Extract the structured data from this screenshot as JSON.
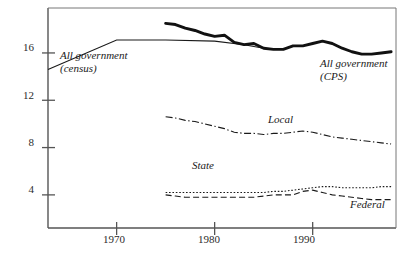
{
  "chart_data": {
    "type": "line",
    "title": "",
    "xlabel": "",
    "ylabel": "",
    "xlim": [
      1963,
      1998.5
    ],
    "ylim": [
      1.2,
      19.8
    ],
    "grid": false,
    "legend_position": "inline-annotations",
    "xticks": [
      1970,
      1980,
      1990
    ],
    "xtick_labels": [
      "1970",
      "1980",
      "1990"
    ],
    "yticks": [
      4,
      8,
      12,
      16
    ],
    "ytick_labels": [
      "4",
      "8",
      "12",
      "16"
    ],
    "series": [
      {
        "name": "All government (census)",
        "style": "thin-solid",
        "label_text_line1": "All government",
        "label_text_line2": "(census)",
        "x": [
          1963,
          1970,
          1975,
          1980,
          1983,
          1985
        ],
        "values": [
          14.6,
          17.1,
          17.1,
          17.0,
          16.7,
          16.4
        ]
      },
      {
        "name": "All government (CPS)",
        "style": "thick-solid",
        "label_text_line1": "All government",
        "label_text_line2": "(CPS)",
        "x": [
          1975,
          1976,
          1977,
          1978,
          1979,
          1980,
          1981,
          1982,
          1983,
          1984,
          1985,
          1986,
          1987,
          1988,
          1989,
          1990,
          1991,
          1992,
          1993,
          1994,
          1995,
          1996,
          1997,
          1998
        ],
        "values": [
          18.5,
          18.4,
          18.1,
          17.9,
          17.6,
          17.4,
          17.5,
          16.9,
          16.7,
          16.8,
          16.4,
          16.3,
          16.3,
          16.6,
          16.6,
          16.8,
          17.0,
          16.8,
          16.4,
          16.1,
          15.9,
          15.9,
          16.0,
          16.1
        ]
      },
      {
        "name": "Local",
        "style": "dash-dot",
        "label_text_line1": "Local",
        "x": [
          1975,
          1976,
          1977,
          1978,
          1979,
          1980,
          1981,
          1982,
          1983,
          1984,
          1985,
          1986,
          1987,
          1988,
          1989,
          1990,
          1991,
          1992,
          1993,
          1994,
          1995,
          1996,
          1997,
          1998
        ],
        "values": [
          10.6,
          10.5,
          10.3,
          10.2,
          10.0,
          9.8,
          9.6,
          9.3,
          9.2,
          9.2,
          9.1,
          9.2,
          9.2,
          9.3,
          9.4,
          9.3,
          9.1,
          8.9,
          8.8,
          8.7,
          8.6,
          8.5,
          8.4,
          8.3
        ]
      },
      {
        "name": "State",
        "style": "dotted",
        "label_text_line1": "State",
        "x": [
          1975,
          1976,
          1977,
          1978,
          1979,
          1980,
          1981,
          1982,
          1983,
          1984,
          1985,
          1986,
          1987,
          1988,
          1989,
          1990,
          1991,
          1992,
          1993,
          1994,
          1995,
          1996,
          1997,
          1998
        ],
        "values": [
          4.2,
          4.2,
          4.2,
          4.2,
          4.2,
          4.2,
          4.2,
          4.2,
          4.2,
          4.2,
          4.2,
          4.3,
          4.3,
          4.4,
          4.5,
          4.6,
          4.7,
          4.7,
          4.6,
          4.6,
          4.6,
          4.6,
          4.7,
          4.7
        ]
      },
      {
        "name": "Federal",
        "style": "dashed",
        "label_text_line1": "Federal",
        "x": [
          1975,
          1976,
          1977,
          1978,
          1979,
          1980,
          1981,
          1982,
          1983,
          1984,
          1985,
          1986,
          1987,
          1988,
          1989,
          1990,
          1991,
          1992,
          1993,
          1994,
          1995,
          1996,
          1997,
          1998
        ],
        "values": [
          4.0,
          3.9,
          3.8,
          3.8,
          3.8,
          3.8,
          3.8,
          3.8,
          3.8,
          3.8,
          3.9,
          4.0,
          4.0,
          4.0,
          4.3,
          4.4,
          4.2,
          4.0,
          3.9,
          3.8,
          3.7,
          3.6,
          3.6,
          3.6
        ]
      }
    ]
  },
  "axis": {
    "line_color": "#555555",
    "tick_color": "#555555"
  },
  "series_colors": {
    "all_government_census": "#1a1a1a",
    "all_government_cps": "#111111",
    "local": "#1a1a1a",
    "state": "#1a1a1a",
    "federal": "#1a1a1a"
  },
  "annotations": {
    "census_line1": "All government",
    "census_line2": "(census)",
    "cps_line1": "All government",
    "cps_line2": "(CPS)",
    "local": "Local",
    "state": "State",
    "federal": "Federal"
  },
  "ticks": {
    "y": [
      {
        "label": "16"
      },
      {
        "label": "12"
      },
      {
        "label": "8"
      },
      {
        "label": "4"
      }
    ],
    "x": [
      {
        "label": "1970"
      },
      {
        "label": "1980"
      },
      {
        "label": "1990"
      }
    ]
  }
}
